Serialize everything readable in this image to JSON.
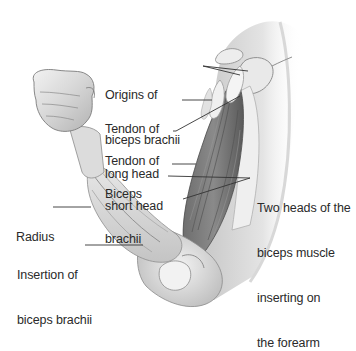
{
  "figure": {
    "colors": {
      "background": "#ffffff",
      "skin_light": "#e9e9e9",
      "skin_mid": "#cfcfcf",
      "skin_shadow": "#9a9a9a",
      "muscle_dark": "#5b5b5b",
      "muscle_mid": "#7c7c7c",
      "tendon": "#f1f1f1",
      "leader_line": "#333333",
      "text": "#2a2a2a"
    }
  },
  "labels": {
    "origins": {
      "line1": "Origins of",
      "line2": "biceps brachii"
    },
    "tendon_long": {
      "line1": "Tendon of",
      "line2": "long head"
    },
    "tendon_short": {
      "line1": "Tendon of",
      "line2": "short head"
    },
    "biceps": {
      "line1": "Biceps",
      "line2": "brachii"
    },
    "two_heads": {
      "line1": "Two heads of the",
      "line2": "biceps muscle",
      "line3": "inserting on",
      "line4": "the forearm"
    },
    "radius": {
      "line1": "Radius"
    },
    "insertion": {
      "line1": "Insertion of",
      "line2": "biceps brachii"
    }
  }
}
